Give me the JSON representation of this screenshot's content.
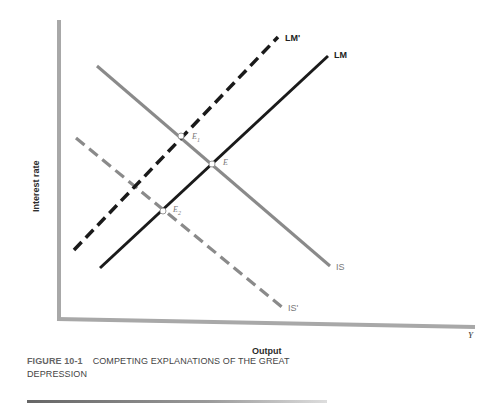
{
  "figure": {
    "number": "FIGURE 10-1",
    "title_line1": "COMPETING EXPLANATIONS OF THE GREAT",
    "title_line2": "DEPRESSION"
  },
  "axes": {
    "y_label": "Interest rate",
    "x_label": "Output",
    "x_variable": "Y"
  },
  "curves": {
    "lm": {
      "label": "LM",
      "style": "solid",
      "color": "#1a1a1a"
    },
    "lm_prime": {
      "label": "LM'",
      "style": "dashed",
      "color": "#1a1a1a"
    },
    "is": {
      "label": "IS",
      "style": "solid",
      "color": "#8a8a8a"
    },
    "is_prime": {
      "label": "IS'",
      "style": "dashed",
      "color": "#8a8a8a"
    }
  },
  "equilibria": {
    "e": {
      "label": "E",
      "sub": ""
    },
    "e1": {
      "label": "E",
      "sub": "1"
    },
    "e2": {
      "label": "E",
      "sub": "2"
    }
  },
  "colors": {
    "axis": "#a8a8a8",
    "lm": "#1a1a1a",
    "is": "#8a8a8a"
  }
}
